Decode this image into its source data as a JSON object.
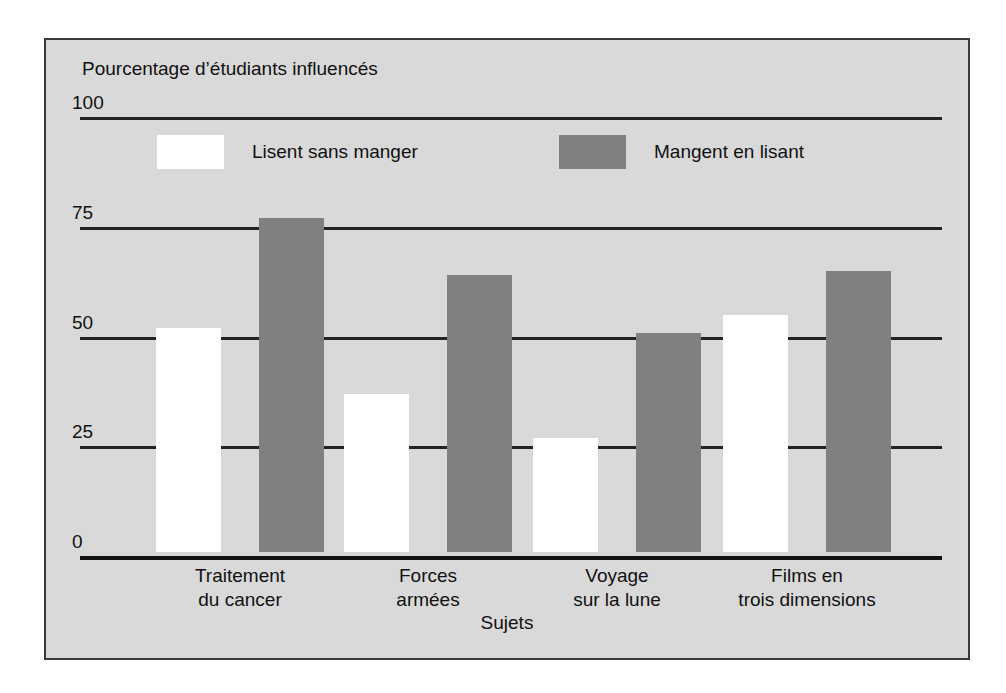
{
  "chart_data": {
    "type": "bar",
    "title": "",
    "ylabel": "Pourcentage d’étudiants influencés",
    "xlabel": "Sujets",
    "ylim": [
      0,
      100
    ],
    "yticks": [
      0,
      25,
      50,
      75,
      100
    ],
    "ytick_labels": [
      "0",
      "25",
      "50",
      "75",
      "100"
    ],
    "grid": true,
    "legend_position": "top-inside",
    "categories": [
      "Traitement du cancer",
      "Forces armées",
      "Voyage sur la lune",
      "Films en trois dimensions"
    ],
    "category_lines": [
      [
        "Traitement",
        "du cancer"
      ],
      [
        "Forces",
        "armées"
      ],
      [
        "Voyage",
        "sur la lune"
      ],
      [
        "Films en",
        "trois dimensions"
      ]
    ],
    "series": [
      {
        "name": "Lisent sans manger",
        "color": "#ffffff",
        "values": [
          51,
          36,
          26,
          54
        ]
      },
      {
        "name": "Mangent en lisant",
        "color": "#808080",
        "values": [
          76,
          63,
          50,
          64
        ]
      }
    ]
  },
  "figure": {
    "background_color": "#d9d9d9",
    "border_color": "#3a3a3a",
    "axis_color": "#111111",
    "page_background": "#ffffff"
  }
}
